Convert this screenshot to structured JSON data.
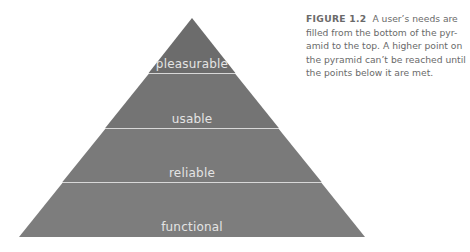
{
  "figure": {
    "label": "FIGURE 1.2",
    "caption_lines": [
      "filled from the bottom of the pyr-",
      "amid to the top. A higher point on",
      "the pyramid can’t be reached until",
      "the points below it are met."
    ],
    "caption_first": "A user’s needs are"
  },
  "pyramid": {
    "levels": [
      {
        "label": "pleasurable",
        "color": "#6c6c6c"
      },
      {
        "label": "usable",
        "color": "#747474"
      },
      {
        "label": "reliable",
        "color": "#7a7a7a"
      },
      {
        "label": "functional",
        "color": "#7d7d7d"
      }
    ],
    "divider_color": "#d8d8d8"
  }
}
